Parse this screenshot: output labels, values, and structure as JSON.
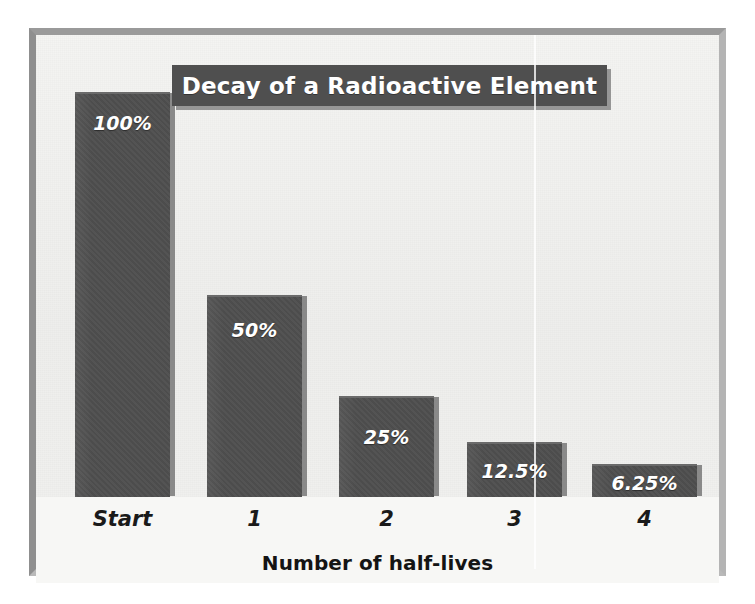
{
  "figure": {
    "title": "Decay of a Radioactive Element",
    "axis_title": "Number of half-lives",
    "colors": {
      "bar_fill": "#4e4e4e",
      "bar_shadow": "#787878",
      "banner_fill": "#4f4f4f",
      "plot_background": "#f1f1ef",
      "frame_border": "#9a9a9a",
      "label_text": "#ffffff",
      "axis_text": "#1a1a1a"
    }
  },
  "chart_data": {
    "type": "bar",
    "title": "Decay of a Radioactive Element",
    "xlabel": "Number of half-lives",
    "ylabel": "",
    "categories": [
      "Start",
      "1",
      "2",
      "3",
      "4"
    ],
    "values": [
      100,
      50,
      25,
      12.5,
      6.25
    ],
    "value_labels": [
      "100%",
      "50%",
      "25%",
      "12.5%",
      "6.25%"
    ],
    "ylim": [
      0,
      100
    ],
    "grid": false,
    "legend": "none",
    "units": "percent of original element remaining"
  },
  "bars": [
    {
      "category": "Start",
      "label": "100%",
      "value": 100,
      "left": 39,
      "width": 95,
      "height": 405,
      "label_top": 18
    },
    {
      "category": "1",
      "label": "50%",
      "value": 50,
      "left": 171,
      "width": 95,
      "height": 202,
      "label_top": 22
    },
    {
      "category": "2",
      "label": "25%",
      "value": 25,
      "left": 303,
      "width": 95,
      "height": 101,
      "label_top": 28
    },
    {
      "category": "3",
      "label": "12.5%",
      "value": 12.5,
      "left": 431,
      "width": 95,
      "height": 55,
      "label_top": 16
    },
    {
      "category": "4",
      "label": "6.25%",
      "value": 6.25,
      "left": 556,
      "width": 105,
      "height": 33,
      "label_top": 6
    }
  ],
  "ticks": [
    {
      "label": "Start",
      "left": 39,
      "width": 95
    },
    {
      "label": "1",
      "left": 171,
      "width": 95
    },
    {
      "label": "2",
      "left": 303,
      "width": 95
    },
    {
      "label": "3",
      "left": 431,
      "width": 95
    },
    {
      "label": "4",
      "left": 556,
      "width": 105
    }
  ],
  "artifact": {
    "scan_line_left": 498
  }
}
